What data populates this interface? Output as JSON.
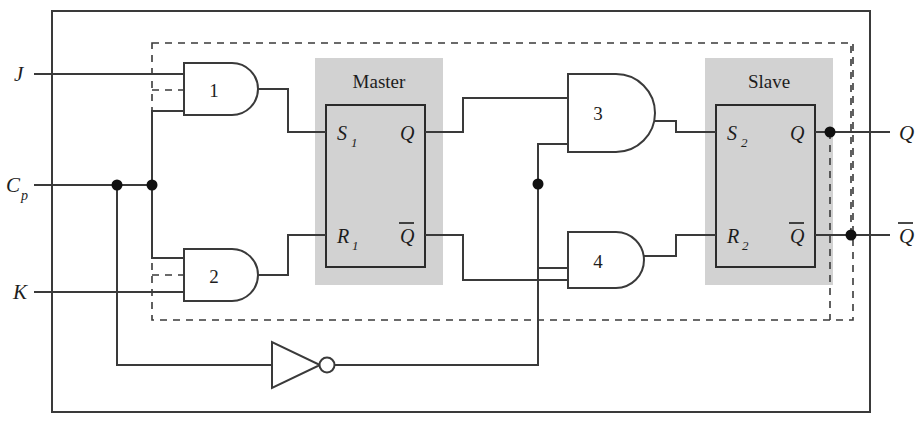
{
  "diagram": {
    "title_master": "Master",
    "title_slave": "Slave",
    "type": "master-slave JK flip-flop logic diagram",
    "colors": {
      "line": "#3a3a3a",
      "block_fill": "#d2d2d2",
      "background": "#ffffff"
    }
  },
  "inputs": [
    {
      "id": "j",
      "label": "J",
      "x": 14,
      "y": 74
    },
    {
      "id": "cp",
      "label": "C",
      "sub": "p",
      "x": 6,
      "y": 186
    },
    {
      "id": "k",
      "label": "K",
      "x": 14,
      "y": 292
    }
  ],
  "outputs": [
    {
      "id": "q",
      "label": "Q",
      "overbar": false,
      "x": 902,
      "y": 133
    },
    {
      "id": "qnot",
      "label": "Q",
      "overbar": true,
      "x": 902,
      "y": 236
    }
  ],
  "gates": [
    {
      "id": "gate1",
      "label": "1",
      "kind": "and",
      "inputs": [
        "J",
        "feedback-Qbar",
        "Cp"
      ]
    },
    {
      "id": "gate2",
      "label": "2",
      "kind": "and",
      "inputs": [
        "Cp",
        "feedback-Q",
        "K"
      ]
    },
    {
      "id": "gate3",
      "label": "3",
      "kind": "and",
      "inputs": [
        "master-Q",
        "inverted-Cp"
      ]
    },
    {
      "id": "gate4",
      "label": "4",
      "kind": "and",
      "inputs": [
        "inverted-Cp",
        "master-Qbar"
      ]
    },
    {
      "id": "inverter",
      "label": "",
      "kind": "not",
      "inputs": [
        "Cp"
      ]
    }
  ],
  "master_block": {
    "title": "Master",
    "pins": [
      {
        "id": "s1",
        "label": "S",
        "sub": "1",
        "overbar": false,
        "side": "left",
        "x": 337,
        "y": 142
      },
      {
        "id": "r1",
        "label": "R",
        "sub": "1",
        "overbar": false,
        "side": "left",
        "x": 337,
        "y": 244
      },
      {
        "id": "mq",
        "label": "Q",
        "sub": "",
        "overbar": false,
        "side": "right",
        "x": 400,
        "y": 142
      },
      {
        "id": "mqbar",
        "label": "Q",
        "sub": "",
        "overbar": true,
        "side": "right",
        "x": 400,
        "y": 244
      }
    ]
  },
  "slave_block": {
    "title": "Slave",
    "pins": [
      {
        "id": "s2",
        "label": "S",
        "sub": "2",
        "overbar": false,
        "side": "left",
        "x": 726,
        "y": 142
      },
      {
        "id": "r2",
        "label": "R",
        "sub": "2",
        "overbar": false,
        "side": "left",
        "x": 726,
        "y": 244
      },
      {
        "id": "sq",
        "label": "Q",
        "sub": "",
        "overbar": false,
        "side": "right",
        "x": 790,
        "y": 142
      },
      {
        "id": "sqbar",
        "label": "Q",
        "sub": "",
        "overbar": true,
        "side": "right",
        "x": 790,
        "y": 244
      }
    ]
  },
  "junctions": [
    {
      "id": "cp-dot-1",
      "x": 117,
      "y": 185
    },
    {
      "id": "cp-dot-2",
      "x": 152,
      "y": 185
    },
    {
      "id": "inv-dot",
      "x": 538,
      "y": 184
    },
    {
      "id": "q-dot",
      "x": 830,
      "y": 132
    },
    {
      "id": "qbar-dot",
      "x": 851,
      "y": 235
    }
  ]
}
